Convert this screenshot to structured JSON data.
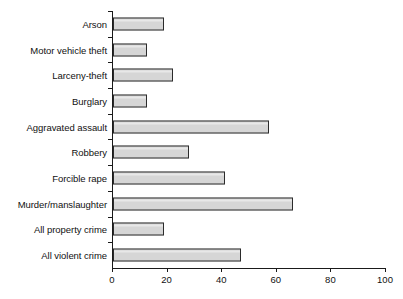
{
  "chart_data": {
    "type": "bar",
    "orientation": "horizontal",
    "title": "",
    "subtitle": "",
    "xlabel": "",
    "ylabel": "",
    "xlim": [
      0,
      100
    ],
    "xticks": [
      0,
      20,
      40,
      60,
      80,
      100
    ],
    "xtick_labels": [
      "0",
      "20",
      "40",
      "60",
      "80",
      "100"
    ],
    "grid": false,
    "legend": false,
    "legend_position": "none",
    "categories": [
      "Arson",
      "Motor vehicle theft",
      "Larceny-theft",
      "Burglary",
      "Aggravated assault",
      "Robbery",
      "Forcible rape",
      "Murder/manslaughter",
      "All property crime",
      "All violent crime"
    ],
    "values": [
      18.5,
      12.5,
      22,
      12.5,
      57,
      28,
      41,
      66,
      18.5,
      47
    ],
    "bars": [
      {
        "label": "Arson",
        "value": 18.5
      },
      {
        "label": "Motor vehicle theft",
        "value": 12.5
      },
      {
        "label": "Larceny-theft",
        "value": 22
      },
      {
        "label": "Burglary",
        "value": 12.5
      },
      {
        "label": "Aggravated assault",
        "value": 57
      },
      {
        "label": "Robbery",
        "value": 28
      },
      {
        "label": "Forcible rape",
        "value": 41
      },
      {
        "label": "Murder/manslaughter",
        "value": 66
      },
      {
        "label": "All property crime",
        "value": 18.5
      },
      {
        "label": "All violent crime",
        "value": 47
      }
    ],
    "colors": {
      "bar_fill": "#d6d6d6",
      "bar_border": "#2b2b2b",
      "axis": "#1a1a1a",
      "text": "#111111",
      "background": "#ffffff"
    }
  }
}
